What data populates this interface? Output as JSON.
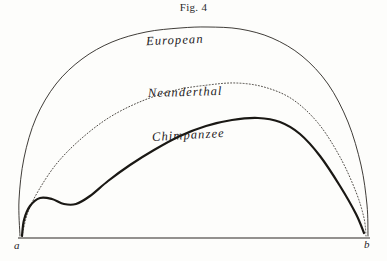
{
  "figure": {
    "caption": "Fig. 4",
    "background_color": "#fdfdfb",
    "ink_color": "#23201c"
  },
  "labels": {
    "european": "European",
    "neanderthal": "Neanderthal",
    "chimpanzee": "Chimpanzee",
    "point_a": "a",
    "point_b": "b"
  },
  "chart_data": {
    "type": "line",
    "title": "Fig. 4",
    "subtitle": "",
    "xlabel": "",
    "ylabel": "",
    "grid": false,
    "legend_position": "inline-on-curve",
    "axis": {
      "baseline_y_px": 238,
      "x_start_px": 18,
      "x_end_px": 370,
      "x_tick_labels": [
        "a",
        "b"
      ],
      "xlim_px": [
        18,
        370
      ],
      "ylim_px": [
        238,
        27
      ]
    },
    "series": [
      {
        "name": "European",
        "style": "solid",
        "line_width": 0.9,
        "color": "#2a2723",
        "apex": {
          "x": 208,
          "y": 27
        },
        "points": [
          {
            "x": 20,
            "y": 236
          },
          {
            "x": 19,
            "y": 200
          },
          {
            "x": 24,
            "y": 158
          },
          {
            "x": 36,
            "y": 118
          },
          {
            "x": 56,
            "y": 84
          },
          {
            "x": 82,
            "y": 59
          },
          {
            "x": 112,
            "y": 42
          },
          {
            "x": 146,
            "y": 32
          },
          {
            "x": 180,
            "y": 28
          },
          {
            "x": 208,
            "y": 27
          },
          {
            "x": 240,
            "y": 29
          },
          {
            "x": 272,
            "y": 38
          },
          {
            "x": 302,
            "y": 56
          },
          {
            "x": 328,
            "y": 84
          },
          {
            "x": 348,
            "y": 122
          },
          {
            "x": 361,
            "y": 165
          },
          {
            "x": 367,
            "y": 205
          },
          {
            "x": 368,
            "y": 236
          }
        ]
      },
      {
        "name": "Neanderthal",
        "style": "dotted",
        "line_width": 0.9,
        "color": "#3a3630",
        "apex": {
          "x": 236,
          "y": 83
        },
        "points": [
          {
            "x": 22,
            "y": 236
          },
          {
            "x": 28,
            "y": 212
          },
          {
            "x": 40,
            "y": 188
          },
          {
            "x": 58,
            "y": 162
          },
          {
            "x": 82,
            "y": 138
          },
          {
            "x": 110,
            "y": 117
          },
          {
            "x": 142,
            "y": 101
          },
          {
            "x": 176,
            "y": 90
          },
          {
            "x": 208,
            "y": 85
          },
          {
            "x": 236,
            "y": 83
          },
          {
            "x": 264,
            "y": 87
          },
          {
            "x": 292,
            "y": 99
          },
          {
            "x": 318,
            "y": 123
          },
          {
            "x": 340,
            "y": 157
          },
          {
            "x": 356,
            "y": 192
          },
          {
            "x": 364,
            "y": 218
          },
          {
            "x": 366,
            "y": 236
          }
        ]
      },
      {
        "name": "Chimpanzee",
        "style": "solid",
        "line_width": 2.2,
        "color": "#1a1814",
        "apex": {
          "x": 258,
          "y": 118
        },
        "points": [
          {
            "x": 22,
            "y": 236
          },
          {
            "x": 24,
            "y": 220
          },
          {
            "x": 30,
            "y": 206
          },
          {
            "x": 40,
            "y": 198
          },
          {
            "x": 52,
            "y": 199
          },
          {
            "x": 64,
            "y": 204
          },
          {
            "x": 76,
            "y": 204
          },
          {
            "x": 90,
            "y": 196
          },
          {
            "x": 108,
            "y": 181
          },
          {
            "x": 130,
            "y": 165
          },
          {
            "x": 154,
            "y": 150
          },
          {
            "x": 180,
            "y": 136
          },
          {
            "x": 206,
            "y": 126
          },
          {
            "x": 232,
            "y": 120
          },
          {
            "x": 258,
            "y": 118
          },
          {
            "x": 280,
            "y": 122
          },
          {
            "x": 300,
            "y": 134
          },
          {
            "x": 320,
            "y": 156
          },
          {
            "x": 340,
            "y": 186
          },
          {
            "x": 356,
            "y": 214
          },
          {
            "x": 364,
            "y": 233
          }
        ]
      }
    ]
  }
}
